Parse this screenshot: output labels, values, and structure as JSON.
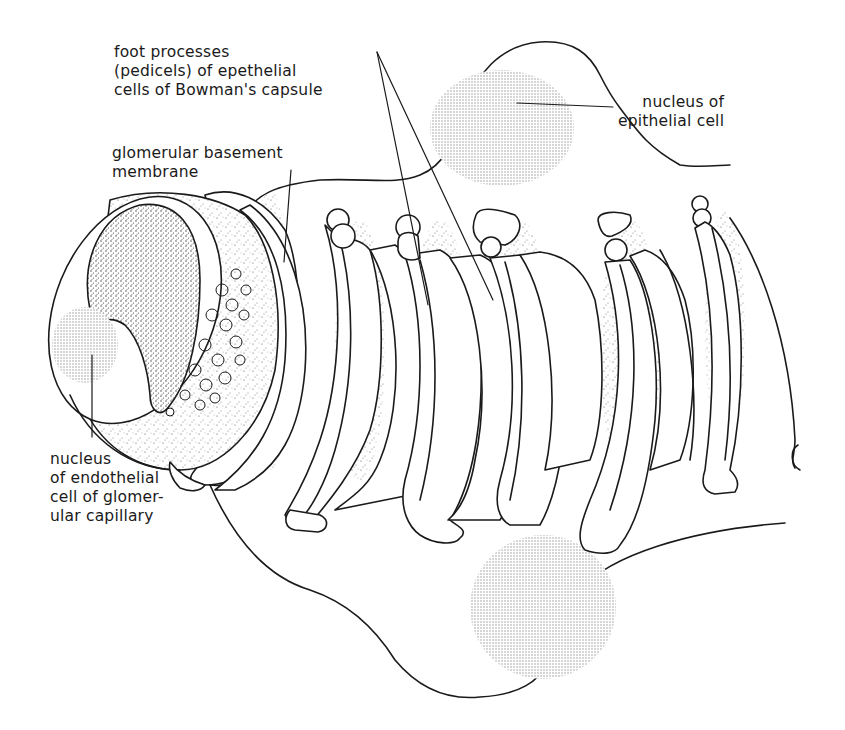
{
  "diagram": {
    "labels": {
      "foot_processes": "foot processes\n(pedicels) of epethelial\ncells of Bowman's capsule",
      "basement_membrane": "glomerular basement\nmembrane",
      "epithelial_nucleus": "nucleus of\nepithelial cell",
      "endothelial_nucleus": "nucleus\nof endothelial\ncell of glomer-\nular capillary"
    },
    "structures": [
      {
        "name": "capillary-endothelium-ring",
        "type": "cut tube with fenestrations"
      },
      {
        "name": "basement-membrane",
        "type": "band around capillary"
      },
      {
        "name": "epithelial-cell-top",
        "type": "podocyte body with nucleus"
      },
      {
        "name": "epithelial-cell-bottom",
        "type": "podocyte body with nucleus"
      },
      {
        "name": "foot-processes",
        "count": 6
      }
    ],
    "colors": {
      "line": "#1a1a1a",
      "background": "#ffffff",
      "stipple": "#9a9a9a"
    }
  }
}
